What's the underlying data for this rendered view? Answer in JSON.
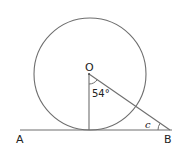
{
  "diagram": {
    "type": "geometry",
    "points": {
      "O": {
        "label": "O",
        "x": 89,
        "y": 74
      },
      "A": {
        "label": "A",
        "x": 20,
        "y": 130
      },
      "B": {
        "label": "B",
        "x": 170,
        "y": 130
      },
      "T": {
        "label": "",
        "x": 89,
        "y": 130
      }
    },
    "circle": {
      "center": "O",
      "radius": 56
    },
    "angles": {
      "at_O": {
        "label": "54°",
        "value_deg": 54
      },
      "at_B": {
        "label": "c"
      }
    },
    "labels": {
      "O": "O",
      "A": "A",
      "B": "B",
      "angle_O": "54°",
      "angle_B": "c"
    },
    "colors": {
      "stroke": "#6e6e6e",
      "text": "#222222",
      "background": "#ffffff"
    }
  }
}
